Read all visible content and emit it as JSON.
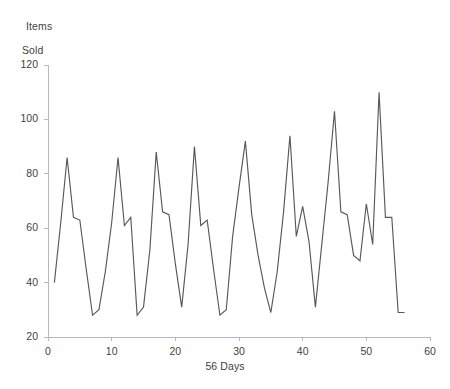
{
  "chart_data": {
    "type": "line",
    "title": "",
    "ylabel": "Items\nSold",
    "ylabel_line1": "Items",
    "ylabel_line2": "Sold",
    "xlabel": "56 Days",
    "xlim": [
      0,
      60
    ],
    "ylim": [
      20,
      120
    ],
    "grid": false,
    "legend": null,
    "line_color": "#585858",
    "axis_color": "#b9b9b9",
    "text_color": "#3f3f3f",
    "background_color": "#ffffff",
    "yticks": [
      20,
      40,
      60,
      80,
      100,
      120
    ],
    "ytick_labels": [
      "20",
      "40",
      "60",
      "80",
      "100",
      "120"
    ],
    "xticks": [
      0,
      10,
      20,
      30,
      40,
      50,
      60
    ],
    "xtick_labels": [
      "0",
      "10",
      "20",
      "30",
      "40",
      "50",
      "60"
    ],
    "series": [
      {
        "name": "Items Sold",
        "x": [
          1,
          2,
          3,
          4,
          5,
          6,
          7,
          8,
          9,
          10,
          11,
          12,
          13,
          14,
          15,
          16,
          17,
          18,
          19,
          20,
          21,
          22,
          23,
          24,
          25,
          26,
          27,
          28,
          29,
          30,
          31,
          32,
          33,
          34,
          35,
          36,
          37,
          38,
          39,
          40,
          41,
          42,
          43,
          44,
          45,
          46,
          47,
          48,
          49,
          50,
          51,
          52,
          53,
          54,
          55,
          56
        ],
        "values": [
          40,
          62,
          86,
          64,
          63,
          45,
          28,
          30,
          44,
          62,
          86,
          61,
          64,
          28,
          31,
          52,
          88,
          66,
          65,
          47,
          31,
          54,
          90,
          61,
          63,
          45,
          28,
          30,
          57,
          75,
          92,
          65,
          50,
          38,
          29,
          44,
          66,
          94,
          57,
          68,
          55,
          31,
          54,
          77,
          103,
          66,
          65,
          50,
          48,
          69,
          54,
          110,
          64,
          64,
          29,
          29
        ]
      }
    ]
  }
}
